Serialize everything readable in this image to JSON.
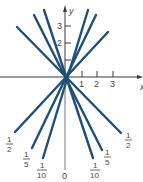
{
  "diagram": {
    "x_axis_label": "x",
    "y_axis_label": "y",
    "x_ticks": [
      "1",
      "2",
      "3"
    ],
    "y_ticks": [
      "1",
      "2",
      "3"
    ],
    "line_color": "#1f4e79",
    "lines": [
      {
        "label_num": "1",
        "label_den": "2",
        "side": "left",
        "slope": -1.0
      },
      {
        "label_num": "1",
        "label_den": "5",
        "side": "left",
        "slope": -2.6
      },
      {
        "label_num": "1",
        "label_den": "10",
        "side": "left",
        "slope": -3.2
      },
      {
        "label_num": "1",
        "label_den": "10",
        "side": "right",
        "slope": 3.2
      },
      {
        "label_num": "1",
        "label_den": "5",
        "side": "right",
        "slope": 2.6
      },
      {
        "label_num": "1",
        "label_den": "2",
        "side": "right",
        "slope": 1.0
      }
    ],
    "zero_label": "0"
  }
}
